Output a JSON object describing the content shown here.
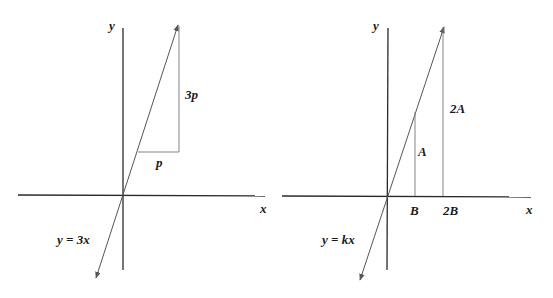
{
  "diagrams": [
    {
      "id": "left",
      "axes": {
        "x_label": "x",
        "y_label": "y"
      },
      "line_label": "y = 3x",
      "run_label": "p",
      "rise_label": "3p"
    },
    {
      "id": "right",
      "axes": {
        "x_label": "x",
        "y_label": "y"
      },
      "line_label": "y = kx",
      "x_ticks": [
        "B",
        "2B"
      ],
      "height_labels": [
        "A",
        "2A"
      ]
    }
  ],
  "colors": {
    "axis": "#2a2a2a",
    "line": "#555555",
    "guide": "#777777",
    "text": "#1a1a1a",
    "background": "#ffffff"
  }
}
